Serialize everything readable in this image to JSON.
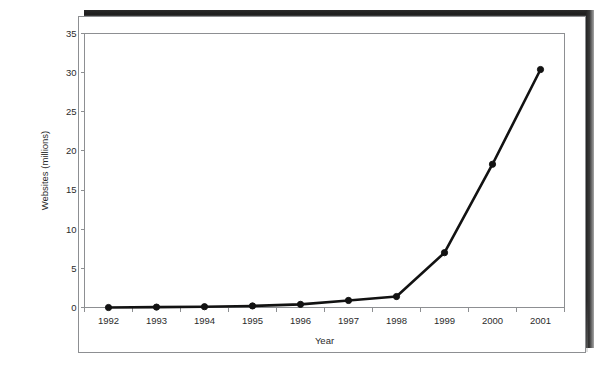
{
  "chart_data": {
    "type": "line",
    "title": "",
    "xlabel": "Year",
    "ylabel": "Websites (millions)",
    "categories": [
      "1992",
      "1993",
      "1994",
      "1995",
      "1996",
      "1997",
      "1998",
      "1999",
      "2000",
      "2001"
    ],
    "values": [
      0.0,
      0.05,
      0.1,
      0.2,
      0.4,
      0.9,
      1.4,
      7.0,
      18.3,
      30.4
    ],
    "series": [
      {
        "name": "Websites",
        "values": [
          0.0,
          0.05,
          0.1,
          0.2,
          0.4,
          0.9,
          1.4,
          7.0,
          18.3,
          30.4
        ]
      }
    ],
    "ylim": [
      0,
      35
    ],
    "ytick_values": [
      0,
      5,
      10,
      15,
      20,
      25,
      30,
      35
    ],
    "ytick_labels": [
      "0",
      "5",
      "10",
      "15",
      "20",
      "25",
      "30",
      "35"
    ],
    "grid": false,
    "legend": false,
    "legend_position": "none",
    "marker": "filled-circle",
    "line_color": "#121212",
    "marker_color": "#121212",
    "axis_color": "#8d8f92",
    "background_color": "#ffffff"
  },
  "figure": {
    "frame_border_color": "#8d8f92",
    "shadow_color": "#242424"
  }
}
